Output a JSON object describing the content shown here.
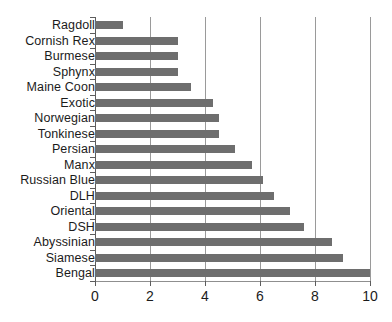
{
  "chart_data": {
    "type": "bar",
    "orientation": "horizontal",
    "title": "",
    "xlabel": "",
    "ylabel": "",
    "xlim": [
      0,
      10
    ],
    "xticks": [
      "0",
      "2",
      "4",
      "6",
      "8",
      "10"
    ],
    "xtick_values": [
      0,
      2,
      4,
      6,
      8,
      10
    ],
    "grid": "vertical",
    "legend": "none",
    "bar_color": "#6e6e6e",
    "axis_color": "#5d5d5d",
    "gridline_color": "#9a9a9a",
    "background_color": "#ffffff",
    "categories": [
      "Ragdoll",
      "Cornish Rex",
      "Burmese",
      "Sphynx",
      "Maine Coon",
      "Exotic",
      "Norwegian",
      "Tonkinese",
      "Persian",
      "Manx",
      "Russian Blue",
      "DLH",
      "Oriental",
      "DSH",
      "Abyssinian",
      "Siamese",
      "Bengal"
    ],
    "values": [
      1.0,
      3.0,
      3.0,
      3.0,
      3.5,
      4.3,
      4.5,
      4.5,
      5.1,
      5.7,
      6.1,
      6.5,
      7.1,
      7.6,
      8.6,
      9.0,
      10.0
    ]
  }
}
